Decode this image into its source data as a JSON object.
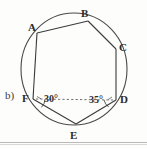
{
  "figure": {
    "part_label": "b)",
    "type": "inscribed-hexagon-in-circle",
    "shape_name": "hexagon ABCDEF",
    "vertices": [
      {
        "label": "A",
        "x": 37,
        "y": 33,
        "label_x": 28,
        "label_y": 22
      },
      {
        "label": "B",
        "x": 88,
        "y": 21,
        "label_x": 81,
        "label_y": 8
      },
      {
        "label": "C",
        "x": 116,
        "y": 49,
        "label_x": 119,
        "label_y": 43
      },
      {
        "label": "D",
        "x": 116,
        "y": 100,
        "label_x": 120,
        "label_y": 95
      },
      {
        "label": "E",
        "x": 76,
        "y": 124,
        "label_x": 70,
        "label_y": 131
      },
      {
        "label": "F",
        "x": 33,
        "y": 99,
        "label_x": 23,
        "label_y": 93
      }
    ],
    "circle": {
      "cx": 74,
      "cy": 69,
      "r": 53
    },
    "chords": [
      {
        "from": "A",
        "to": "B"
      },
      {
        "from": "B",
        "to": "C"
      },
      {
        "from": "C",
        "to": "D"
      },
      {
        "from": "D",
        "to": "E"
      },
      {
        "from": "E",
        "to": "F"
      },
      {
        "from": "F",
        "to": "A"
      }
    ],
    "dashed_segments": [
      {
        "from": "F",
        "to": "D",
        "style": "dashed"
      }
    ],
    "angles": [
      {
        "name": "angle-at-F",
        "at_vertex": "F",
        "value": "30",
        "unit": "°",
        "text": "30°",
        "label_x": 44,
        "label_y": 95,
        "arc_cx": 33,
        "arc_cy": 99
      },
      {
        "name": "angle-at-D",
        "at_vertex": "D",
        "value": "35",
        "unit": "°",
        "text": "35°",
        "label_x": 90,
        "label_y": 96,
        "arc_cx": 116,
        "arc_cy": 100
      }
    ],
    "colors": {
      "ink": "#3b3b3b",
      "ink_dark": "#2a2a2a",
      "dashed": "#6a6a6a",
      "paper": "#fdfdfc",
      "scan_edge": "#b9b9b9"
    }
  }
}
